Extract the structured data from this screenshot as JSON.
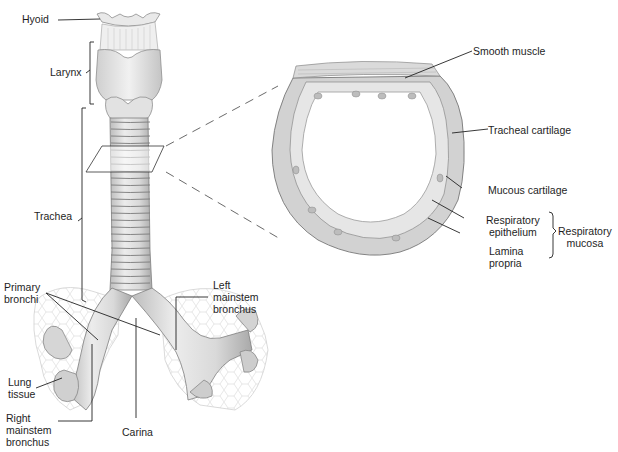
{
  "figure": {
    "labels": {
      "hyoid": "Hyoid",
      "larynx": "Larynx",
      "trachea": "Trachea",
      "primary_bronchi": "Primary\nbronchi",
      "left_mainstem_bronchus": "Left\nmainstem\nbronchus",
      "lung_tissue": "Lung\ntissue",
      "right_mainstem_bronchus": "Right\nmainstem\nbronchus",
      "carina": "Carina",
      "smooth_muscle": "Smooth muscle",
      "tracheal_cartilage": "Tracheal cartilage",
      "mucous_cartilage": "Mucous cartilage",
      "respiratory_epithelium": "Respiratory\nepithelium",
      "lamina_propria": "Lamina\npropria",
      "respiratory_mucosa": "Respiratory\nmucosa"
    },
    "colors": {
      "line": "#2a2a2a",
      "tissue_light": "#e6e6e6",
      "tissue_mid": "#cfcfcf",
      "tissue_dark": "#9a9a9a",
      "cartilage": "#d2d2d2"
    }
  }
}
